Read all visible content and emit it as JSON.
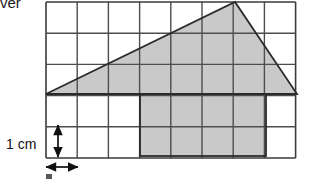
{
  "figure": {
    "type": "geometry-grid-diagram",
    "grid": {
      "columns": 8,
      "rows": 5,
      "cell_size_px": 31.2,
      "origin_x_px": 46,
      "origin_y_px": 2,
      "line_color": "#4d4d4d",
      "line_width_px": 1.4,
      "border_color": "#3a3a3a"
    },
    "shapes": [
      {
        "name": "shaded-triangle",
        "kind": "triangle",
        "fill": "#c9c9c9",
        "stroke": "#2b2b2b",
        "vertices_px": [
          [
            46,
            94
          ],
          [
            235,
            2
          ],
          [
            297,
            94
          ]
        ],
        "vertices_cells": [
          [
            0,
            3
          ],
          [
            6.05,
            0
          ],
          [
            8.05,
            3
          ]
        ]
      },
      {
        "name": "shaded-rectangle",
        "kind": "rectangle",
        "fill": "#c9c9c9",
        "stroke": "#2b2b2b",
        "x_px": 140,
        "y_px": 94,
        "width_px": 126,
        "height_px": 62,
        "cells_wide": 4,
        "cells_tall": 2
      }
    ],
    "annotations": {
      "cut_off_text": "ver",
      "vertical_scale_label": "1 cm",
      "vertical_arrow": {
        "name": "vertical-double-arrow",
        "x_px": 58,
        "y_top_px": 125,
        "y_bottom_px": 157,
        "color": "#111111",
        "spans_cells": 1
      },
      "horizontal_arrow": {
        "name": "horizontal-double-arrow",
        "y_px": 167,
        "x_left_px": 46,
        "x_right_px": 78,
        "color": "#111111",
        "spans_cells": 1
      }
    },
    "colors": {
      "shade": "#c9c9c9",
      "outline": "#2b2b2b",
      "grid": "#4d4d4d",
      "text": "#111111",
      "background": "#ffffff"
    }
  }
}
